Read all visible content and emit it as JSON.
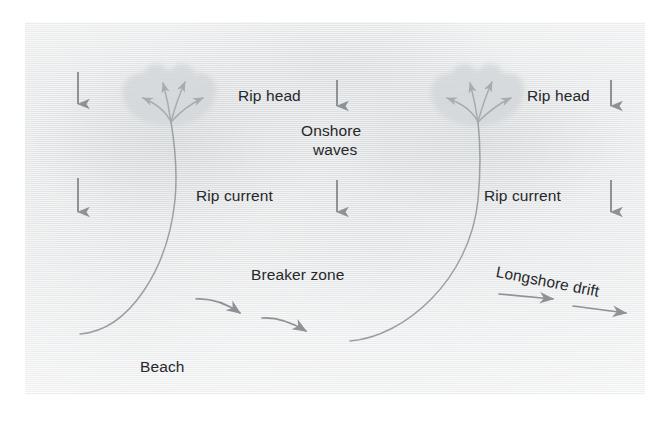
{
  "figure": {
    "type": "coastal-process-diagram",
    "background_color": "#e9eaeb",
    "ink_color": "#26282b",
    "arrow_color": "#8d9296",
    "current_line_color": "#9aa0a4",
    "rip_head_fill": "#d3d6d8"
  },
  "labels": [
    {
      "id": "rip-head-left",
      "text": "Rip head",
      "x": 238,
      "y": 86,
      "style": "plain"
    },
    {
      "id": "rip-head-right",
      "text": "Rip head",
      "x": 527,
      "y": 86,
      "style": "plain"
    },
    {
      "id": "onshore-waves-line1",
      "text": "Onshore",
      "x": 301,
      "y": 121,
      "style": "plain"
    },
    {
      "id": "onshore-waves-line2",
      "text": "waves",
      "x": 313,
      "y": 140,
      "style": "plain"
    },
    {
      "id": "rip-current-left",
      "text": "Rip current",
      "x": 196,
      "y": 186,
      "style": "plain"
    },
    {
      "id": "rip-current-right",
      "text": "Rip current",
      "x": 484,
      "y": 186,
      "style": "plain"
    },
    {
      "id": "breaker-zone",
      "text": "Breaker zone",
      "x": 251,
      "y": 265,
      "style": "plain"
    },
    {
      "id": "longshore-drift",
      "text": "Longshore drift",
      "x": 498,
      "y": 262,
      "style": "slanted"
    },
    {
      "id": "beach",
      "text": "Beach",
      "x": 140,
      "y": 357,
      "style": "plain"
    }
  ],
  "onshore_wave_arrows": [
    {
      "id": "wave-arrow-left-top",
      "x": 78,
      "y1": 72,
      "y2": 110
    },
    {
      "id": "wave-arrow-left-bottom",
      "x": 78,
      "y1": 178,
      "y2": 218
    },
    {
      "id": "wave-arrow-mid-top",
      "x": 337,
      "y1": 80,
      "y2": 112
    },
    {
      "id": "wave-arrow-mid-bottom",
      "x": 337,
      "y1": 180,
      "y2": 218
    },
    {
      "id": "wave-arrow-right-top",
      "x": 611,
      "y1": 80,
      "y2": 112
    },
    {
      "id": "wave-arrow-right-bottom",
      "x": 611,
      "y1": 180,
      "y2": 218
    }
  ],
  "rip_heads": [
    {
      "id": "rip-head-shape-left",
      "cx": 170,
      "cy": 100
    },
    {
      "id": "rip-head-shape-right",
      "cx": 478,
      "cy": 100
    }
  ],
  "rip_currents": [
    {
      "id": "rip-current-curve-left",
      "from": [
        80,
        334
      ],
      "to": [
        171,
        122
      ]
    },
    {
      "id": "rip-current-curve-right",
      "from": [
        350,
        341
      ],
      "to": [
        478,
        122
      ]
    }
  ],
  "breaker_arrows": [
    {
      "id": "breaker-arrow-1",
      "from": [
        196,
        299
      ],
      "to": [
        247,
        316
      ]
    },
    {
      "id": "breaker-arrow-2",
      "from": [
        262,
        318
      ],
      "to": [
        314,
        334
      ]
    }
  ],
  "longshore_drift_arrows": [
    {
      "id": "longshore-arrow-1",
      "from": [
        499,
        295
      ],
      "to": [
        560,
        299
      ]
    },
    {
      "id": "longshore-arrow-2",
      "from": [
        573,
        307
      ],
      "to": [
        633,
        314
      ]
    }
  ]
}
